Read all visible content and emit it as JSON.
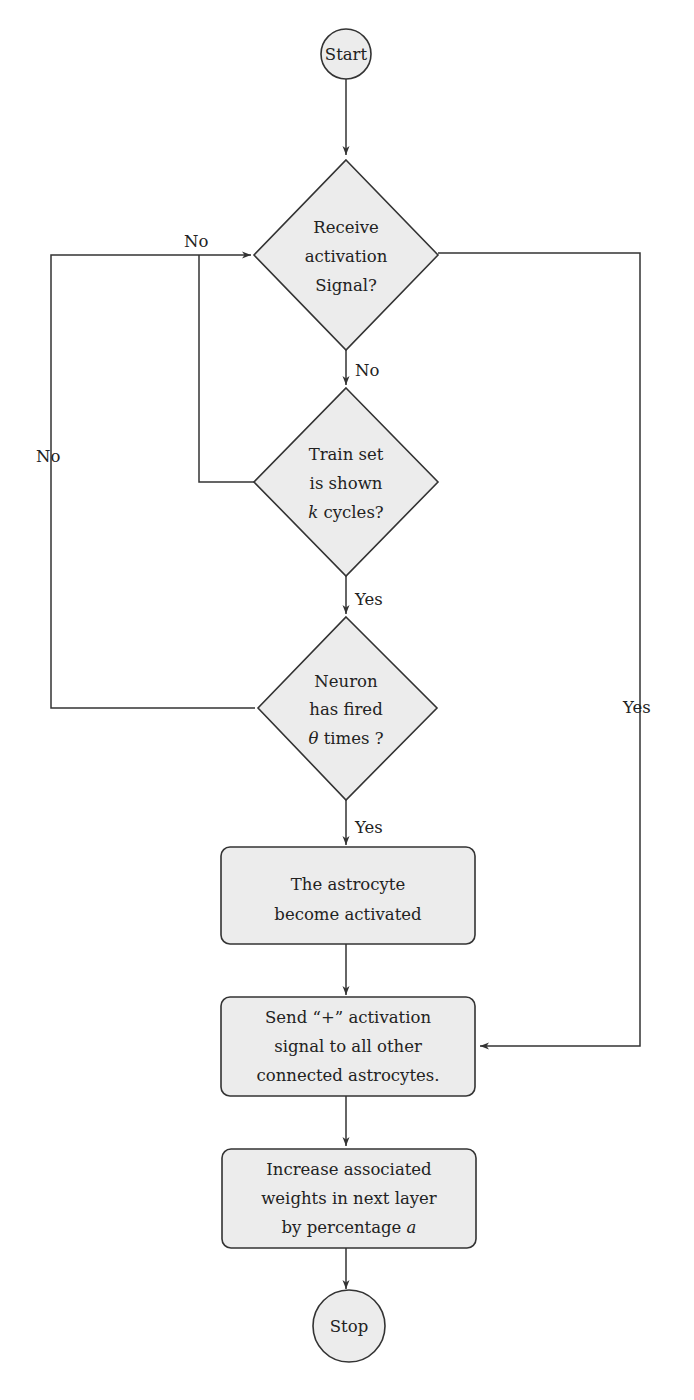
{
  "diagram": {
    "type": "flowchart",
    "colors": {
      "node_fill": "#ececec",
      "stroke": "#333333",
      "text": "#222222",
      "background": "#ffffff"
    },
    "nodes": {
      "start": {
        "shape": "circle",
        "label": "Start"
      },
      "receive": {
        "shape": "diamond",
        "lines": [
          "Receive",
          "activation",
          "Signal?"
        ]
      },
      "train": {
        "shape": "diamond",
        "lines": [
          "Train set",
          "is shown",
          "cycles?"
        ],
        "var": "k"
      },
      "neuron": {
        "shape": "diamond",
        "lines": [
          "Neuron",
          "has fired",
          "times ?"
        ],
        "var": "θ"
      },
      "astro": {
        "shape": "rounded-rect",
        "lines": [
          "The astrocyte",
          "become activated"
        ]
      },
      "send": {
        "shape": "rounded-rect",
        "lines": [
          "Send “+” activation",
          "signal to all other",
          "connected astrocytes."
        ]
      },
      "increase": {
        "shape": "rounded-rect",
        "lines": [
          "Increase associated",
          "weights in next layer",
          "by percentage"
        ],
        "var": "a"
      },
      "stop": {
        "shape": "circle",
        "label": "Stop"
      }
    },
    "edges": [
      {
        "from": "start",
        "to": "receive",
        "label": ""
      },
      {
        "from": "receive",
        "to": "train",
        "label": "No"
      },
      {
        "from": "train",
        "to": "receive",
        "label": "No"
      },
      {
        "from": "train",
        "to": "neuron",
        "label": "Yes"
      },
      {
        "from": "neuron",
        "to": "receive",
        "label": "No"
      },
      {
        "from": "neuron",
        "to": "astro",
        "label": "Yes"
      },
      {
        "from": "receive",
        "to": "send",
        "label": "Yes"
      },
      {
        "from": "astro",
        "to": "send",
        "label": ""
      },
      {
        "from": "send",
        "to": "increase",
        "label": ""
      },
      {
        "from": "increase",
        "to": "stop",
        "label": ""
      }
    ]
  }
}
